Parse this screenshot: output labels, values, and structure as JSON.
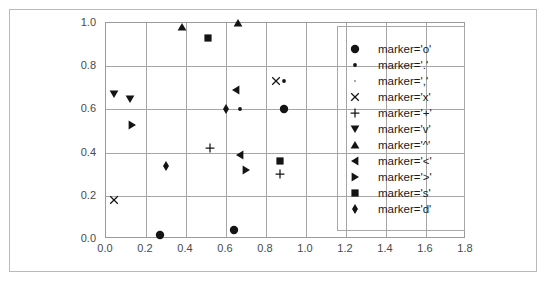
{
  "chart_data": {
    "type": "scatter",
    "title": "",
    "subtitle": "",
    "xlabel": "",
    "ylabel": "",
    "xlim": [
      0.0,
      1.8
    ],
    "ylim": [
      0.0,
      1.0
    ],
    "xticks": [
      "0.0",
      "0.2",
      "0.4",
      "0.6",
      "0.8",
      "1.0",
      "1.2",
      "1.4",
      "1.6",
      "1.8"
    ],
    "xtick_values": [
      0.0,
      0.2,
      0.4,
      0.6,
      0.8,
      1.0,
      1.2,
      1.4,
      1.6,
      1.8
    ],
    "yticks": [
      "0.0",
      "0.2",
      "0.4",
      "0.6",
      "0.8",
      "1.0"
    ],
    "ytick_values": [
      0.0,
      0.2,
      0.4,
      0.6,
      0.8,
      1.0
    ],
    "grid": true,
    "grid_color": "#a6a6a6",
    "marker_color": "#141414",
    "legend_position": "right-inside",
    "series": [
      {
        "name": "marker='o'",
        "marker": "o",
        "legend_glyph": "circle",
        "points": [
          {
            "x": 0.27,
            "y": 0.02
          },
          {
            "x": 0.64,
            "y": 0.04
          },
          {
            "x": 0.89,
            "y": 0.6
          }
        ]
      },
      {
        "name": "marker='.'",
        "marker": ".",
        "legend_glyph": "point",
        "points": [
          {
            "x": 0.67,
            "y": 0.6
          },
          {
            "x": 0.89,
            "y": 0.73
          }
        ]
      },
      {
        "name": "marker=','",
        "marker": ",",
        "legend_glyph": "pixel",
        "points": []
      },
      {
        "name": "marker='x'",
        "marker": "x",
        "legend_glyph": "cross-x",
        "points": [
          {
            "x": 0.04,
            "y": 0.18
          },
          {
            "x": 0.85,
            "y": 0.73
          }
        ]
      },
      {
        "name": "marker='+'",
        "marker": "+",
        "legend_glyph": "plus",
        "points": [
          {
            "x": 0.52,
            "y": 0.42
          },
          {
            "x": 0.87,
            "y": 0.3
          }
        ]
      },
      {
        "name": "marker='v'",
        "marker": "v",
        "legend_glyph": "triangle-down",
        "points": [
          {
            "x": 0.04,
            "y": 0.67
          },
          {
            "x": 0.12,
            "y": 0.65
          }
        ]
      },
      {
        "name": "marker='^'",
        "marker": "^",
        "legend_glyph": "triangle-up",
        "points": [
          {
            "x": 0.38,
            "y": 0.98
          },
          {
            "x": 0.66,
            "y": 1.0
          }
        ]
      },
      {
        "name": "marker='<'",
        "marker": "<",
        "legend_glyph": "triangle-left",
        "points": [
          {
            "x": 0.65,
            "y": 0.69
          },
          {
            "x": 0.67,
            "y": 0.39
          }
        ]
      },
      {
        "name": "marker='>'",
        "marker": ">",
        "legend_glyph": "triangle-right",
        "points": [
          {
            "x": 0.13,
            "y": 0.53
          },
          {
            "x": 0.7,
            "y": 0.32
          }
        ]
      },
      {
        "name": "marker='s'",
        "marker": "s",
        "legend_glyph": "square",
        "points": [
          {
            "x": 0.51,
            "y": 0.93
          },
          {
            "x": 0.87,
            "y": 0.36
          }
        ]
      },
      {
        "name": "marker='d'",
        "marker": "d",
        "legend_glyph": "thin-diamond",
        "points": [
          {
            "x": 0.3,
            "y": 0.34
          },
          {
            "x": 0.6,
            "y": 0.6
          }
        ]
      }
    ]
  }
}
